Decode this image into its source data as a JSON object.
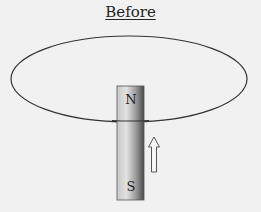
{
  "title": "Before",
  "magnet": {
    "top_pole": "N",
    "bottom_pole": "S"
  },
  "arrow": {
    "direction": "up",
    "icon": "up-arrow-icon"
  },
  "colors": {
    "background": "#f1f1f1",
    "loop_stroke": "#333333",
    "magnet_light": "#d8d8d8",
    "magnet_dark": "#555555"
  }
}
